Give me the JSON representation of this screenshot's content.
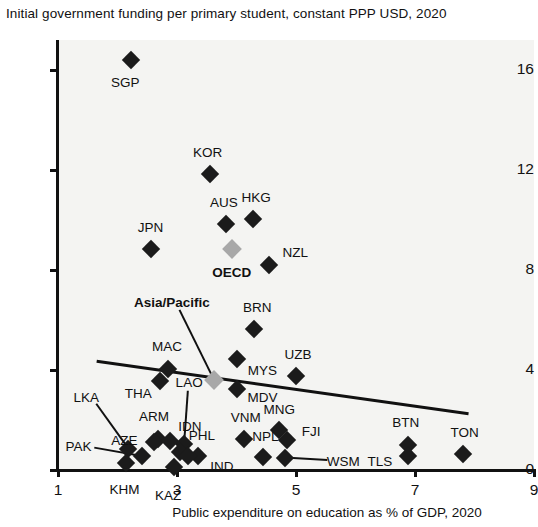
{
  "chart_data": {
    "type": "scatter",
    "title": "Initial government funding per primary student, constant PPP USD, 2020",
    "xlabel": "Public expenditure on education as % of GDP, 2020",
    "ylabel": "Initial government funding per primary student, constant PPP USD, 2020",
    "xlim": [
      1,
      9
    ],
    "ylim": [
      0,
      17.2
    ],
    "xticks": [
      1,
      3,
      5,
      7,
      9
    ],
    "yticks": [
      0,
      4,
      8,
      12,
      16
    ],
    "grid": false,
    "legend": null,
    "trendline": {
      "label": "linear trend",
      "x_start": 1.65,
      "y_start": 4.35,
      "x_end": 7.9,
      "y_end": 2.25
    },
    "points": [
      {
        "code": "SGP",
        "x": 2.23,
        "y": 16.4,
        "kind": "country",
        "label_dx": -6,
        "label_dy": 22
      },
      {
        "code": "KOR",
        "x": 3.55,
        "y": 11.85,
        "kind": "country",
        "label_dx": -2,
        "label_dy": -22
      },
      {
        "code": "AUS",
        "x": 3.82,
        "y": 9.85,
        "kind": "country",
        "label_dx": -2,
        "label_dy": -22
      },
      {
        "code": "HKG",
        "x": 4.28,
        "y": 10.05,
        "kind": "country",
        "label_dx": 3,
        "label_dy": -22
      },
      {
        "code": "JPN",
        "x": 2.57,
        "y": 8.85,
        "kind": "country",
        "label_dx": -1,
        "label_dy": -22
      },
      {
        "code": "OECD",
        "x": 3.92,
        "y": 8.85,
        "kind": "aggregate",
        "label_dx": 0,
        "label_dy": 23
      },
      {
        "code": "NZL",
        "x": 4.55,
        "y": 8.2,
        "kind": "country",
        "label_dx": 26,
        "label_dy": -13
      },
      {
        "code": "BRN",
        "x": 4.3,
        "y": 5.65,
        "kind": "country",
        "label_dx": 3,
        "label_dy": -22
      },
      {
        "code": "MYS",
        "x": 4.0,
        "y": 4.45,
        "kind": "country",
        "label_dx": 26,
        "label_dy": 11
      },
      {
        "code": "MAC",
        "x": 2.85,
        "y": 4.05,
        "kind": "country",
        "label_dx": -1,
        "label_dy": -23
      },
      {
        "code": "UZB",
        "x": 5.0,
        "y": 3.75,
        "kind": "country",
        "label_dx": 2,
        "label_dy": -22
      },
      {
        "code": "THA",
        "x": 2.72,
        "y": 3.55,
        "kind": "country",
        "label_dx": -22,
        "label_dy": 12
      },
      {
        "code": "Asia/Pacific",
        "x": 3.62,
        "y": 3.6,
        "kind": "aggregate",
        "label_dx": -42,
        "label_dy": -78
      },
      {
        "code": "MDV",
        "x": 4.0,
        "y": 3.25,
        "kind": "country",
        "label_dx": 26,
        "label_dy": 8
      },
      {
        "code": "LAO",
        "x": 3.12,
        "y": 1.05,
        "kind": "country",
        "label_dx": 5,
        "label_dy": -62
      },
      {
        "code": "MNG",
        "x": 4.72,
        "y": 1.6,
        "kind": "country",
        "label_dx": 0,
        "label_dy": -21
      },
      {
        "code": "FJI",
        "x": 4.85,
        "y": 1.2,
        "kind": "country",
        "label_dx": 24,
        "label_dy": -9
      },
      {
        "code": "VNM",
        "x": 4.12,
        "y": 1.25,
        "kind": "country",
        "label_dx": 2,
        "label_dy": -22
      },
      {
        "code": "BTN",
        "x": 6.88,
        "y": 1.0,
        "kind": "country",
        "label_dx": -2,
        "label_dy": -23
      },
      {
        "code": "TLS",
        "x": 6.88,
        "y": 0.55,
        "kind": "country",
        "label_dx": -28,
        "label_dy": 5
      },
      {
        "code": "TON",
        "x": 7.8,
        "y": 0.65,
        "kind": "country",
        "label_dx": 2,
        "label_dy": -22
      },
      {
        "code": "ARM",
        "x": 2.68,
        "y": 1.25,
        "kind": "country",
        "label_dx": -4,
        "label_dy": -23
      },
      {
        "code": "AZE",
        "x": 2.62,
        "y": 1.12,
        "kind": "country",
        "label_dx": -30,
        "label_dy": -2
      },
      {
        "code": "IDN",
        "x": 2.88,
        "y": 1.18,
        "kind": "country",
        "label_dx": 20,
        "label_dy": -15
      },
      {
        "code": "LKA",
        "x": 2.18,
        "y": 0.85,
        "kind": "country",
        "label_dx": -42,
        "label_dy": -52
      },
      {
        "code": "PAK",
        "x": 2.42,
        "y": 0.55,
        "kind": "country",
        "label_dx": -64,
        "label_dy": -10
      },
      {
        "code": "PHL",
        "x": 3.05,
        "y": 0.72,
        "kind": "country",
        "label_dx": 22,
        "label_dy": -17
      },
      {
        "code": "IND",
        "x": 3.35,
        "y": 0.55,
        "kind": "country",
        "label_dx": 24,
        "label_dy": 10
      },
      {
        "code": "IND2",
        "x": 3.18,
        "y": 0.58,
        "kind": "country-nolabel",
        "label_dx": 0,
        "label_dy": 0
      },
      {
        "code": "KHM",
        "x": 2.15,
        "y": 0.3,
        "kind": "country",
        "label_dx": -2,
        "label_dy": 26
      },
      {
        "code": "KAZ",
        "x": 2.95,
        "y": 0.12,
        "kind": "country",
        "label_dx": -6,
        "label_dy": 28
      },
      {
        "code": "NPL",
        "x": 4.45,
        "y": 0.52,
        "kind": "country",
        "label_dx": 2,
        "label_dy": -21
      },
      {
        "code": "WSM",
        "x": 4.82,
        "y": 0.5,
        "kind": "country",
        "label_dx": 58,
        "label_dy": 3
      }
    ]
  }
}
